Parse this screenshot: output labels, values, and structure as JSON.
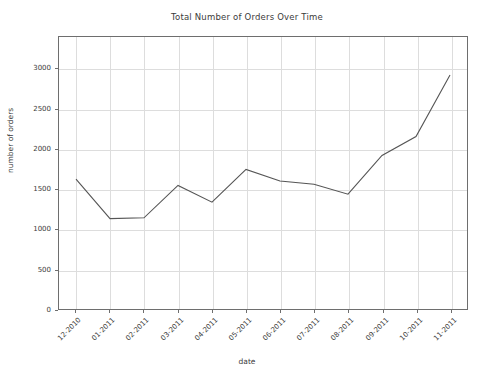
{
  "chart_data": {
    "type": "line",
    "title": "Total Number of Orders Over Time",
    "xlabel": "date",
    "ylabel": "number of orders",
    "categories": [
      "12-2010",
      "01-2011",
      "02-2011",
      "03-2011",
      "04-2011",
      "05-2011",
      "06-2011",
      "07-2011",
      "08-2011",
      "09-2011",
      "10-2011",
      "11-2011"
    ],
    "values": [
      1624,
      1130,
      1140,
      1545,
      1335,
      1744,
      1600,
      1560,
      1435,
      1920,
      2155,
      2925
    ],
    "series": [
      {
        "name": "number of orders",
        "values": [
          1624,
          1130,
          1140,
          1545,
          1335,
          1744,
          1600,
          1560,
          1435,
          1920,
          2155,
          2925
        ]
      }
    ],
    "yticks": [
      0,
      500,
      1000,
      1500,
      2000,
      2500,
      3000
    ],
    "ytick_labels": [
      "0",
      "500",
      "1000",
      "1500",
      "2000",
      "2500",
      "3000"
    ],
    "ylim": [
      0,
      3400
    ],
    "grid": true,
    "legend": "none",
    "line_color": "#555555"
  }
}
